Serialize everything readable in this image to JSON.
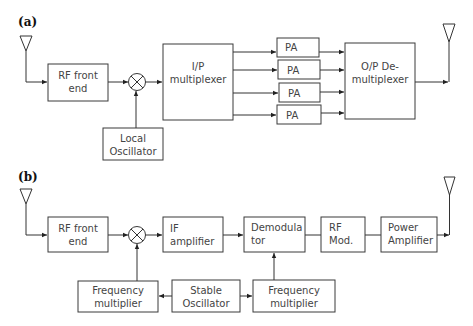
{
  "panels": {
    "a": {
      "label": "(a)",
      "rf_front_end": [
        "RF front",
        "end"
      ],
      "local_oscillator": [
        "Local",
        "Oscillator"
      ],
      "ip_multiplexer": [
        "I/P",
        "multiplexer"
      ],
      "pa": [
        "PA",
        "PA",
        "PA",
        "PA"
      ],
      "op_demultiplexer": [
        "O/P De-",
        "multiplexer"
      ]
    },
    "b": {
      "label": "(b)",
      "rf_front_end": [
        "RF front",
        "end"
      ],
      "if_amplifier": [
        "IF",
        "amplifier"
      ],
      "demodulator": [
        "Demodula",
        "tor"
      ],
      "rf_mod": [
        "RF",
        "Mod."
      ],
      "power_amplifier": [
        "Power",
        "Amplifier"
      ],
      "freq_mult_left": [
        "Frequency",
        "multiplier"
      ],
      "stable_oscillator": [
        "Stable",
        "Oscillator"
      ],
      "freq_mult_right": [
        "Frequency",
        "multiplier"
      ]
    }
  },
  "colors": {
    "line": "#333333",
    "text": "#444444",
    "background": "#ffffff"
  }
}
